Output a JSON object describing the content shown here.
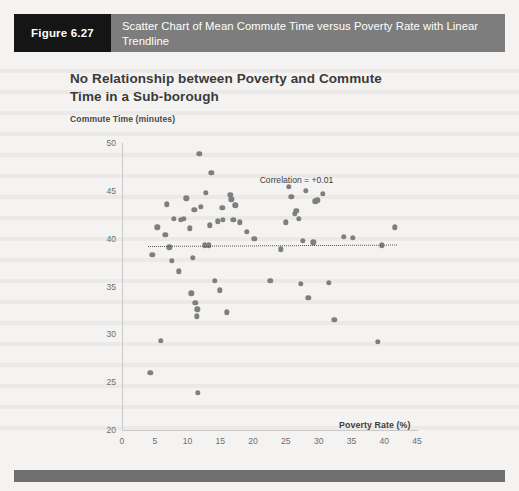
{
  "figure": {
    "number_label": "Figure 6.27",
    "caption": "Scatter Chart of Mean Commute Time versus Poverty Rate with Linear Trendline"
  },
  "colors": {
    "caption_bar": "#7d7d7d",
    "figure_number_block": "#151515",
    "point": "#7f7f7f",
    "trendline": "#555555",
    "axis": "#c9c9c9",
    "bottom_bar": "#6f6f6f",
    "page_background": "#f4f3f1"
  },
  "chart_data": {
    "type": "scatter",
    "title": "No Relationship between Poverty and Commute Time in a Sub-borough",
    "xlabel": "Poverty Rate (%)",
    "ylabel": "Commute Time (minutes)",
    "xlim": [
      0,
      45
    ],
    "ylim": [
      20,
      50
    ],
    "xticks": [
      0,
      5,
      10,
      15,
      20,
      25,
      30,
      35,
      40,
      45
    ],
    "yticks": [
      20,
      25,
      30,
      35,
      40,
      45,
      50
    ],
    "grid": false,
    "legend": false,
    "annotations": [
      {
        "text": "Correlation = +0.01",
        "x": 21.0,
        "y": 46.7
      }
    ],
    "series": [
      {
        "name": "Sub-boroughs",
        "marker": "circle",
        "color": "#7f7f7f",
        "points": [
          [
            4.3,
            26.0
          ],
          [
            4.6,
            38.3
          ],
          [
            5.4,
            41.2
          ],
          [
            5.9,
            29.3
          ],
          [
            6.6,
            40.4
          ],
          [
            6.8,
            43.6
          ],
          [
            7.2,
            39.1
          ],
          [
            7.6,
            37.7
          ],
          [
            7.9,
            42.1
          ],
          [
            8.7,
            36.6
          ],
          [
            9.0,
            42.0
          ],
          [
            9.4,
            42.1
          ],
          [
            9.8,
            44.2
          ],
          [
            10.3,
            41.1
          ],
          [
            10.6,
            34.3
          ],
          [
            10.8,
            38.0
          ],
          [
            11.0,
            43.0
          ],
          [
            11.2,
            33.3
          ],
          [
            11.4,
            31.9
          ],
          [
            11.5,
            32.6
          ],
          [
            11.6,
            23.9
          ],
          [
            11.8,
            48.9
          ],
          [
            12.0,
            43.3
          ],
          [
            12.6,
            39.3
          ],
          [
            12.8,
            44.8
          ],
          [
            13.2,
            39.3
          ],
          [
            13.4,
            41.4
          ],
          [
            13.6,
            46.9
          ],
          [
            14.2,
            35.6
          ],
          [
            14.6,
            41.8
          ],
          [
            14.9,
            34.6
          ],
          [
            15.3,
            43.2
          ],
          [
            15.4,
            42.0
          ],
          [
            16.0,
            32.3
          ],
          [
            16.5,
            44.6
          ],
          [
            16.7,
            44.1
          ],
          [
            17.0,
            42.0
          ],
          [
            17.3,
            43.5
          ],
          [
            18.0,
            41.7
          ],
          [
            19.0,
            40.7
          ],
          [
            20.2,
            40.0
          ],
          [
            22.6,
            35.6
          ],
          [
            24.2,
            38.9
          ],
          [
            25.0,
            41.7
          ],
          [
            25.4,
            45.4
          ],
          [
            25.8,
            44.4
          ],
          [
            26.4,
            42.6
          ],
          [
            26.6,
            42.9
          ],
          [
            27.0,
            42.1
          ],
          [
            27.3,
            35.3
          ],
          [
            27.6,
            39.8
          ],
          [
            28.0,
            45.0
          ],
          [
            28.4,
            33.8
          ],
          [
            29.2,
            39.6
          ],
          [
            29.5,
            43.9
          ],
          [
            29.8,
            44.0
          ],
          [
            30.6,
            44.7
          ],
          [
            31.5,
            35.4
          ],
          [
            32.4,
            31.5
          ],
          [
            33.8,
            40.2
          ],
          [
            35.2,
            40.1
          ],
          [
            39.0,
            29.2
          ],
          [
            39.6,
            39.3
          ],
          [
            41.6,
            41.2
          ]
        ]
      }
    ],
    "trendline": {
      "style": "dotted",
      "color": "#555555",
      "x_start": 4.0,
      "x_end": 42.0,
      "y_start": 39.25,
      "y_end": 39.4
    }
  }
}
